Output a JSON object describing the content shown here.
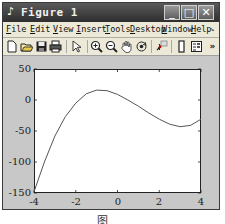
{
  "window": {
    "title": "Figure 1",
    "controls": {
      "minimize": "_",
      "maximize": "□",
      "close": "✕"
    }
  },
  "menubar": {
    "items": [
      {
        "label": "File",
        "mnemonic": "F",
        "rest": "ile"
      },
      {
        "label": "Edit",
        "mnemonic": "E",
        "rest": "dit"
      },
      {
        "label": "View",
        "mnemonic": "V",
        "rest": "iew"
      },
      {
        "label": "Insert",
        "mnemonic": "I",
        "rest": "nsert"
      },
      {
        "label": "Tools",
        "mnemonic": "T",
        "rest": "ools"
      },
      {
        "label": "Desktop",
        "mnemonic": "D",
        "rest": "esktop"
      },
      {
        "label": "Window",
        "mnemonic": "W",
        "rest": "indow"
      },
      {
        "label": "Help",
        "mnemonic": "H",
        "rest": "elp"
      }
    ],
    "overflow": "↘"
  },
  "toolbar": {
    "icons": [
      {
        "name": "new-figure-icon",
        "glyph": "🗋"
      },
      {
        "name": "open-file-icon",
        "glyph": "📂"
      },
      {
        "name": "save-icon",
        "glyph": "💾"
      },
      {
        "name": "print-icon",
        "glyph": "🖶"
      },
      {
        "name": "edit-plot-arrow-icon",
        "glyph": "⇖"
      },
      {
        "name": "zoom-in-icon",
        "glyph": "⊕"
      },
      {
        "name": "zoom-out-icon",
        "glyph": "⊖"
      },
      {
        "name": "pan-hand-icon",
        "glyph": "✋"
      },
      {
        "name": "rotate-3d-icon",
        "glyph": "⟳"
      },
      {
        "name": "data-cursor-icon",
        "glyph": "✱"
      },
      {
        "name": "colorbar-icon",
        "glyph": "▯"
      },
      {
        "name": "legend-icon",
        "glyph": "▤"
      }
    ],
    "overflow": "»"
  },
  "chart_data": {
    "type": "line",
    "title": "",
    "xlabel": "",
    "ylabel": "",
    "xlim": [
      -4,
      4
    ],
    "ylim": [
      -150,
      50
    ],
    "xticks": [
      "-4",
      "-2",
      "0",
      "2",
      "4"
    ],
    "yticks": [
      "50",
      "0",
      "-50",
      "-100",
      "-150"
    ],
    "grid": false,
    "series": [
      {
        "name": "curve",
        "color": "#555555",
        "x": [
          -4,
          -3.5,
          -3,
          -2.5,
          -2,
          -1.5,
          -1,
          -0.5,
          0,
          0.5,
          1,
          1.5,
          2,
          2.5,
          3,
          3.5,
          4
        ],
        "y": [
          -148,
          -100,
          -58,
          -27,
          -5,
          10,
          16,
          15,
          9,
          0,
          -10,
          -21,
          -31,
          -39,
          -43,
          -41,
          -31
        ]
      }
    ]
  },
  "caption": "图"
}
